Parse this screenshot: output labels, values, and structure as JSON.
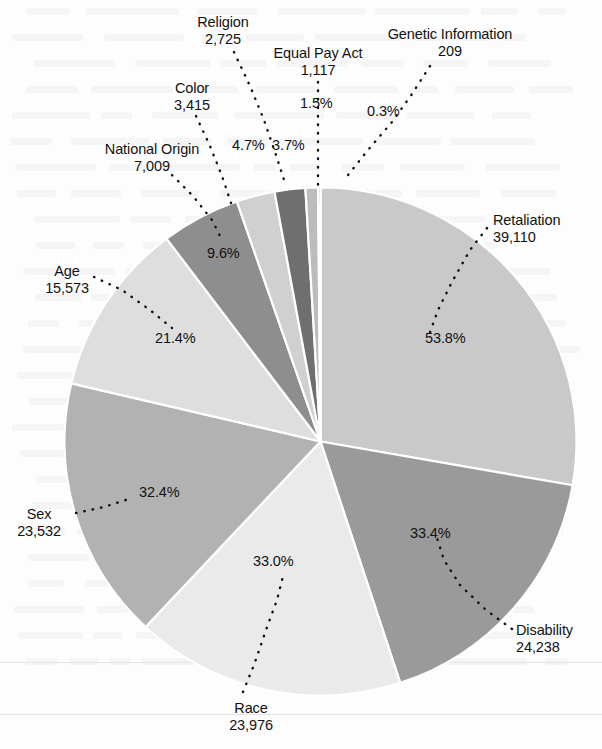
{
  "chart_data": {
    "type": "pie",
    "title": "",
    "subtitle": "",
    "xlabel": "",
    "ylabel": "",
    "legend_position": "none",
    "grid": false,
    "note": "Percentages total more than 100% because some charges allege multiple bases.",
    "categories": [
      "Retaliation",
      "Disability",
      "Race",
      "Sex",
      "Age",
      "National Origin",
      "Color",
      "Religion",
      "Equal Pay Act",
      "Genetic Information"
    ],
    "values": [
      39110,
      24238,
      23976,
      23532,
      15573,
      7009,
      3415,
      2725,
      1117,
      209
    ],
    "percent_labels": [
      "53.8%",
      "33.4%",
      "33.0%",
      "32.4%",
      "21.4%",
      "9.6%",
      "4.7%",
      "3.7%",
      "1.5%",
      "0.3%"
    ],
    "value_labels": [
      "39,110",
      "24,238",
      "23,976",
      "23,532",
      "15,573",
      "7,009",
      "3,415",
      "2,725",
      "1,117",
      "209"
    ],
    "slice_colors": [
      "#c9c9c9",
      "#9a9a9a",
      "#eaeaea",
      "#b2b2b2",
      "#dedede",
      "#8e8e8e",
      "#d0d0d0",
      "#6f6f6f",
      "#bcbcbc",
      "#555555"
    ],
    "slice_separator_color": "#ffffff",
    "leader_line_color": "#111111",
    "background_color": "#fdfdfd"
  },
  "slices": [
    {
      "name": "Retaliation",
      "value": "39,110",
      "percent": "53.8%"
    },
    {
      "name": "Disability",
      "value": "24,238",
      "percent": "33.4%"
    },
    {
      "name": "Race",
      "value": "23,976",
      "percent": "33.0%"
    },
    {
      "name": "Sex",
      "value": "23,532",
      "percent": "32.4%"
    },
    {
      "name": "Age",
      "value": "15,573",
      "percent": "21.4%"
    },
    {
      "name": "National Origin",
      "value": "7,009",
      "percent": "9.6%"
    },
    {
      "name": "Color",
      "value": "3,415",
      "percent": "4.7%"
    },
    {
      "name": "Religion",
      "value": "2,725",
      "percent": "3.7%"
    },
    {
      "name": "Equal Pay Act",
      "value": "1,117",
      "percent": "1.5%"
    },
    {
      "name": "Genetic Information",
      "value": "209",
      "percent": "0.3%"
    }
  ]
}
